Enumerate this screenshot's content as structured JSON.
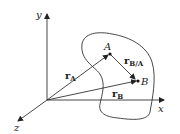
{
  "diagram": {
    "type": "relative-position-vectors",
    "axes": {
      "x_label": "x",
      "y_label": "y",
      "z_label": "z"
    },
    "points": {
      "A_label": "A",
      "B_label": "B"
    },
    "vectors": {
      "rA": {
        "base": "r",
        "sub": "A"
      },
      "rB": {
        "base": "r",
        "sub": "B"
      },
      "rBA": {
        "base": "r",
        "sub": "B/A"
      }
    },
    "colors": {
      "line": "#333333",
      "background": "#ffffff"
    }
  }
}
